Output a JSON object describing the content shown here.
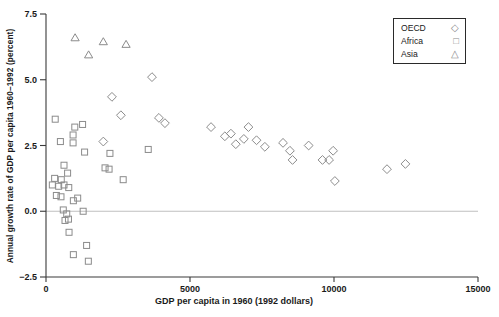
{
  "chart_data": {
    "type": "scatter",
    "title": "",
    "xlabel": "GDP per capita in 1960 (1992 dollars)",
    "ylabel": "Annual growth rate of GDP per capita 1960–1992 (percent)",
    "xlim": [
      0,
      15000
    ],
    "ylim": [
      -2.5,
      7.5
    ],
    "xticks": [
      {
        "label": "0",
        "value": 0
      },
      {
        "label": "5000",
        "value": 5000
      },
      {
        "label": "10000",
        "value": 10000
      },
      {
        "label": "15000",
        "value": 15000
      }
    ],
    "yticks": [
      {
        "label": "7.5",
        "value": 7.5
      },
      {
        "label": "5.0",
        "value": 5.0
      },
      {
        "label": "2.5",
        "value": 2.5
      },
      {
        "label": "0.0",
        "value": 0.0
      },
      {
        "label": "−2.5",
        "value": -2.5
      }
    ],
    "zero_reference_line": 0,
    "grid": "zero-line-only",
    "legend_position": "top-right",
    "marker_color": "#8b8b8b",
    "axis_color": "#3a3a3a",
    "zero_line_color": "#b8b8b8",
    "series": [
      {
        "name": "OECD",
        "marker": "diamond",
        "marker_glyph": "◇",
        "points": [
          [
            1990,
            2.65
          ],
          [
            2290,
            4.35
          ],
          [
            2600,
            3.65
          ],
          [
            3680,
            5.1
          ],
          [
            3920,
            3.55
          ],
          [
            4130,
            3.35
          ],
          [
            5730,
            3.2
          ],
          [
            6210,
            2.85
          ],
          [
            6420,
            2.95
          ],
          [
            6590,
            2.55
          ],
          [
            6870,
            2.75
          ],
          [
            7030,
            3.2
          ],
          [
            7310,
            2.7
          ],
          [
            7600,
            2.45
          ],
          [
            8230,
            2.6
          ],
          [
            8470,
            2.3
          ],
          [
            8560,
            1.95
          ],
          [
            9120,
            2.5
          ],
          [
            9600,
            1.95
          ],
          [
            9830,
            1.95
          ],
          [
            9970,
            2.3
          ],
          [
            10030,
            1.15
          ],
          [
            11840,
            1.6
          ],
          [
            12480,
            1.8
          ]
        ]
      },
      {
        "name": "Africa",
        "marker": "square",
        "marker_glyph": "□",
        "points": [
          [
            320,
            3.5
          ],
          [
            1270,
            3.3
          ],
          [
            1000,
            3.2
          ],
          [
            940,
            2.9
          ],
          [
            500,
            2.65
          ],
          [
            940,
            2.6
          ],
          [
            1340,
            2.25
          ],
          [
            2220,
            2.2
          ],
          [
            3550,
            2.35
          ],
          [
            625,
            1.75
          ],
          [
            750,
            1.45
          ],
          [
            2050,
            1.65
          ],
          [
            2190,
            1.6
          ],
          [
            2680,
            1.2
          ],
          [
            300,
            1.25
          ],
          [
            530,
            1.2
          ],
          [
            220,
            1.0
          ],
          [
            440,
            0.95
          ],
          [
            625,
            1.0
          ],
          [
            790,
            0.9
          ],
          [
            360,
            0.6
          ],
          [
            520,
            0.55
          ],
          [
            950,
            0.4
          ],
          [
            1100,
            0.5
          ],
          [
            600,
            0.05
          ],
          [
            1290,
            0.0
          ],
          [
            720,
            -0.1
          ],
          [
            660,
            -0.35
          ],
          [
            780,
            -0.3
          ],
          [
            800,
            -0.8
          ],
          [
            1410,
            -1.3
          ],
          [
            950,
            -1.65
          ],
          [
            1470,
            -1.9
          ]
        ]
      },
      {
        "name": "Asia",
        "marker": "triangle",
        "marker_glyph": "△",
        "points": [
          [
            1010,
            6.6
          ],
          [
            1990,
            6.45
          ],
          [
            2780,
            6.35
          ],
          [
            1480,
            5.95
          ]
        ]
      }
    ]
  }
}
